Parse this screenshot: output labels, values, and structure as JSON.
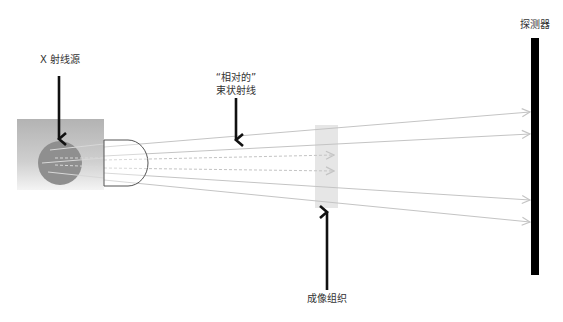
{
  "labels": {
    "source": "X 射线源",
    "beam_line1": "“相对的”",
    "beam_line2": "束状射线",
    "detector": "探测器",
    "tissue": "成像组织"
  },
  "colors": {
    "background": "#ffffff",
    "source_box_top": "#b3b3b3",
    "source_box_bottom": "#f2f2f2",
    "anode": "#8f8f8f",
    "ray": "#c4c4c4",
    "collimator_stroke": "#555555",
    "tissue": "#e6e6e6",
    "detector": "#000000",
    "pointer": "#111111"
  }
}
